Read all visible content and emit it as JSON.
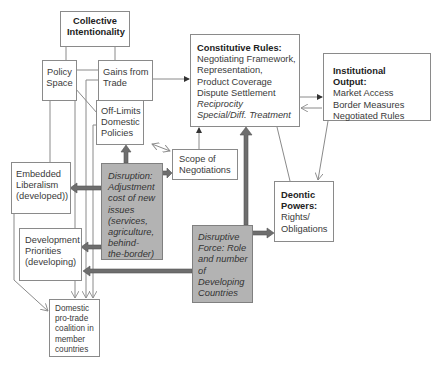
{
  "diagram": {
    "nodes": {
      "collective_intentionality": {
        "title_lines": [
          "Collective",
          "Intentionality"
        ]
      },
      "policy_space": {
        "lines": [
          "Policy",
          "Space"
        ]
      },
      "gains_from_trade": {
        "lines": [
          "Gains from",
          "Trade"
        ]
      },
      "off_limits": {
        "lines": [
          "Off-Limits",
          "Domestic",
          "Policies"
        ]
      },
      "constitutive_rules": {
        "title": "Constitutive Rules:",
        "lines": [
          "Negotiating Framework,",
          "Representation,",
          "Product Coverage",
          "Dispute Settlement"
        ],
        "italic_lines": [
          "Reciprocity",
          "Special/Diff. Treatment"
        ]
      },
      "institutional_output": {
        "title": "Institutional Output:",
        "lines": [
          "Market Access",
          "Border Measures",
          "Negotiated Rules"
        ]
      },
      "scope_of_negotiations": {
        "lines": [
          "Scope of",
          "Negotiations"
        ]
      },
      "embedded_liberalism": {
        "lines": [
          "Embedded",
          "Liberalism",
          "(developed))"
        ]
      },
      "disruption": {
        "lines": [
          "Disruption:",
          "Adjustment",
          "cost of new",
          "issues",
          "(services,",
          "agriculture,",
          "behind-",
          "the-border)"
        ]
      },
      "deontic_powers": {
        "title_lines": [
          "Deontic",
          "Powers:"
        ],
        "lines": [
          "Rights/",
          "Obligations"
        ]
      },
      "development_priorities": {
        "lines": [
          "Development",
          "Priorities",
          "(developing)"
        ]
      },
      "disruptive_force": {
        "lines": [
          "Disruptive",
          "Force: Role",
          "and number",
          "of",
          "Developing",
          "Countries"
        ]
      },
      "domestic_coalition": {
        "lines": [
          "Domestic",
          "pro-trade",
          "coalition in",
          "member",
          "countries"
        ]
      }
    },
    "colors": {
      "line": "#8a8a8a",
      "thick_arrow": "#6e6e6e",
      "grey_box": "#b3b3b3",
      "text": "#3a3a3a"
    }
  }
}
